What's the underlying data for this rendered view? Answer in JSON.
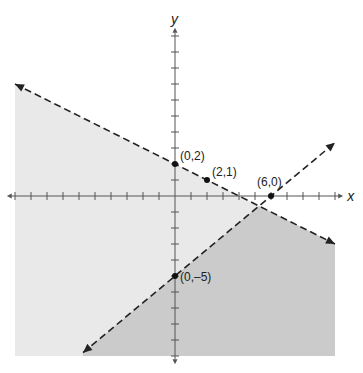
{
  "chart_data": {
    "type": "line",
    "title": "",
    "xlabel": "x",
    "ylabel": "y",
    "xlim": [
      -10,
      10
    ],
    "ylim": [
      -10,
      10
    ],
    "grid": false,
    "tick_step": 1,
    "series": [
      {
        "name": "boundary-1",
        "style": "dashed",
        "slope": -0.5,
        "intercept": 2,
        "x_range": [
          -10,
          10
        ]
      },
      {
        "name": "boundary-2",
        "style": "dashed",
        "slope": 0.8333,
        "intercept": -5,
        "x_range": [
          -5.75,
          10
        ]
      }
    ],
    "points": [
      {
        "x": 0,
        "y": 2,
        "label": "(0,2)"
      },
      {
        "x": 2,
        "y": 1,
        "label": "(2,1)"
      },
      {
        "x": 6,
        "y": 0,
        "label": "(6,0)"
      },
      {
        "x": 0,
        "y": -5,
        "label": "(0,–5)"
      }
    ],
    "shading": [
      {
        "region": "below boundary-1",
        "color": "#e9e9e9"
      },
      {
        "region": "below boundary-1 and below boundary-2",
        "color": "#c9c9c9"
      }
    ]
  }
}
